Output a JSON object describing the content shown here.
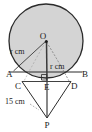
{
  "figure": {
    "type": "geometry-diagram",
    "width": 92,
    "height": 132,
    "colors": {
      "background": "#ffffff",
      "circle_fill": "#d4d4d4",
      "circle_stroke": "#2b2b2b",
      "line_stroke": "#2b2b2b",
      "dashed_stroke": "#6b6b6b",
      "label_color": "#1a1a1a"
    },
    "points": [
      {
        "id": "O",
        "label": "O",
        "x": 46,
        "y": 41,
        "role": "circle-center",
        "dot": true
      },
      {
        "id": "A",
        "label": "A",
        "x": 11,
        "y": 74,
        "role": "chord-left-end",
        "dot": false
      },
      {
        "id": "B",
        "label": "B",
        "x": 81,
        "y": 74,
        "role": "chord-right-end",
        "dot": false
      },
      {
        "id": "C",
        "label": "C",
        "x": 20,
        "y": 86,
        "role": "triangle-left-vertex",
        "dot": false
      },
      {
        "id": "D",
        "label": "D",
        "x": 72,
        "y": 86,
        "role": "triangle-right-vertex",
        "dot": false
      },
      {
        "id": "E",
        "label": "E",
        "x": 48,
        "y": 86,
        "role": "foot-of-perpendicular",
        "dot": false
      },
      {
        "id": "P",
        "label": "P",
        "x": 47,
        "y": 124,
        "role": "apex-below",
        "dot": false
      }
    ],
    "measurements": [
      {
        "id": "radius-left",
        "text": "r cm",
        "symbol": "r",
        "unit": "cm",
        "labels_segment": "O-A",
        "x": 14,
        "y": 51
      },
      {
        "id": "radius-vertical",
        "text": "r cm",
        "symbol": "r",
        "unit": "cm",
        "labels_segment": "O-E",
        "x": 50,
        "y": 70
      },
      {
        "id": "slant-length",
        "text": "15 cm",
        "value": 15,
        "unit": "cm",
        "labels_segment": "C-P",
        "x": 9,
        "y": 105
      }
    ],
    "marks": [
      {
        "id": "right-angle-at-E",
        "type": "right-angle-square",
        "at": "E",
        "x": 42,
        "y": 75
      }
    ],
    "circle": {
      "cx": 46,
      "cy": 41,
      "r": 37
    }
  }
}
